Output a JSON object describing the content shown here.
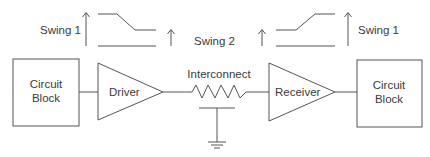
{
  "diagram": {
    "type": "signal-path-block-diagram",
    "colors": {
      "line": "#555555",
      "text": "#3a3a3a",
      "background": "#ffffff"
    },
    "blocks": {
      "source": {
        "line1": "Circuit",
        "line2": "Block"
      },
      "driver": {
        "label": "Driver"
      },
      "interconnect": {
        "label": "Interconnect"
      },
      "receiver": {
        "label": "Receiver"
      },
      "sink": {
        "line1": "Circuit",
        "line2": "Block"
      }
    },
    "swings": {
      "left": {
        "label": "Swing 1",
        "waveform": "falling"
      },
      "middle": {
        "label": "Swing 2"
      },
      "right": {
        "label": "Swing 1",
        "waveform": "rising"
      }
    },
    "connections": [
      [
        "source",
        "driver"
      ],
      [
        "driver",
        "interconnect"
      ],
      [
        "interconnect",
        "receiver"
      ],
      [
        "receiver",
        "sink"
      ]
    ],
    "icons": {
      "interconnect_resistor": "resistor-icon",
      "interconnect_capacitor": "capacitor-icon",
      "ground": "ground-icon",
      "arrow": "up-arrow-icon"
    }
  }
}
